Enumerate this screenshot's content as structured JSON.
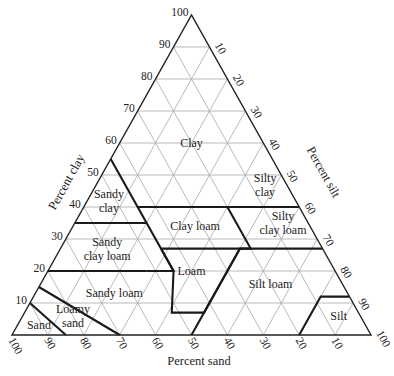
{
  "chart_data": {
    "type": "ternary",
    "title": "",
    "axes": {
      "clay": {
        "label": "Percent clay",
        "ticks": [
          10,
          20,
          30,
          40,
          50,
          60,
          70,
          80,
          90,
          100
        ]
      },
      "silt": {
        "label": "Percent silt",
        "ticks": [
          10,
          20,
          30,
          40,
          50,
          60,
          70,
          80,
          90,
          100
        ]
      },
      "sand": {
        "label": "Percent sand",
        "ticks": [
          100,
          90,
          80,
          70,
          60,
          50,
          40,
          30,
          20,
          10
        ]
      }
    },
    "grid_step": 10,
    "regions": [
      {
        "name": "Clay",
        "label": [
          "Clay"
        ],
        "label_pos": {
          "sand": 20,
          "silt": 20,
          "clay": 60
        }
      },
      {
        "name": "Sandy clay",
        "label": [
          "Sandy",
          "clay"
        ],
        "label_pos": {
          "sand": 52,
          "silt": 6,
          "clay": 42
        }
      },
      {
        "name": "Silty clay",
        "label": [
          "Silty",
          "clay"
        ],
        "label_pos": {
          "sand": 6,
          "silt": 47,
          "clay": 47
        }
      },
      {
        "name": "Clay loam",
        "label": [
          "Clay loam"
        ],
        "label_pos": {
          "sand": 32,
          "silt": 34,
          "clay": 34
        }
      },
      {
        "name": "Silty clay loam",
        "label": [
          "Silty",
          "clay loam"
        ],
        "label_pos": {
          "sand": 7,
          "silt": 58,
          "clay": 35
        }
      },
      {
        "name": "Sandy clay loam",
        "label": [
          "Sandy",
          "clay loam"
        ],
        "label_pos": {
          "sand": 60,
          "silt": 13,
          "clay": 27
        }
      },
      {
        "name": "Loam",
        "label": [
          "Loam"
        ],
        "label_pos": {
          "sand": 40,
          "silt": 40,
          "clay": 20
        }
      },
      {
        "name": "Silt loam",
        "label": [
          "Silt loam"
        ],
        "label_pos": {
          "sand": 20,
          "silt": 64,
          "clay": 16
        }
      },
      {
        "name": "Sandy loam",
        "label": [
          "Sandy loam"
        ],
        "label_pos": {
          "sand": 65,
          "silt": 22,
          "clay": 13
        }
      },
      {
        "name": "Loamy sand",
        "label": [
          "Loamy",
          "sand"
        ],
        "label_pos": {
          "sand": 80,
          "silt": 14,
          "clay": 6
        }
      },
      {
        "name": "Sand",
        "label": [
          "Sand"
        ],
        "label_pos": {
          "sand": 91,
          "silt": 6,
          "clay": 3
        }
      },
      {
        "name": "Silt",
        "label": [
          "Silt"
        ],
        "label_pos": {
          "sand": 6,
          "silt": 88,
          "clay": 6
        }
      }
    ],
    "boundaries": [
      [
        [
          45,
          0,
          55
        ],
        [
          45,
          15,
          40
        ],
        [
          45,
          35,
          20
        ],
        [
          52.5,
          27.5,
          20
        ]
      ],
      [
        [
          65,
          0,
          35
        ],
        [
          45,
          20,
          35
        ]
      ],
      [
        [
          80,
          0,
          20
        ],
        [
          52.5,
          27.5,
          20
        ]
      ],
      [
        [
          0,
          60,
          40
        ],
        [
          20,
          40,
          40
        ],
        [
          20,
          40,
          40
        ],
        [
          45,
          15,
          40
        ]
      ],
      [
        [
          20,
          40,
          40
        ],
        [
          0,
          60,
          40
        ]
      ],
      [
        [
          20,
          40,
          40
        ],
        [
          20,
          53,
          27
        ],
        [
          45,
          28,
          27
        ]
      ],
      [
        [
          0,
          73,
          27
        ],
        [
          20,
          53,
          27
        ]
      ],
      [
        [
          20,
          53,
          27
        ],
        [
          23,
          50,
          27
        ],
        [
          50,
          50,
          0
        ]
      ],
      [
        [
          45,
          28,
          27
        ],
        [
          45,
          35,
          20
        ],
        [
          52,
          41,
          7
        ],
        [
          43,
          50,
          7
        ],
        [
          23,
          50,
          27
        ]
      ],
      [
        [
          85,
          0,
          15
        ],
        [
          70,
          30,
          0
        ]
      ],
      [
        [
          90,
          0,
          10
        ],
        [
          85,
          15,
          0
        ]
      ],
      [
        [
          20,
          80,
          0
        ],
        [
          8,
          80,
          12
        ],
        [
          0,
          88,
          12
        ]
      ]
    ]
  }
}
